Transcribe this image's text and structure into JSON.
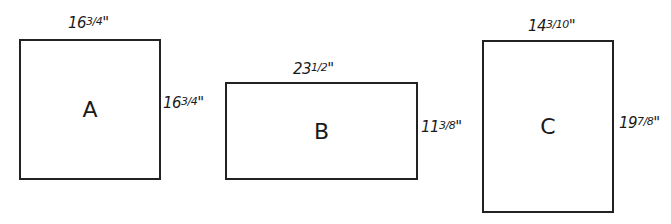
{
  "diagram": {
    "rectangles": [
      {
        "id": "A",
        "label": "A",
        "width_label": "16¾\"",
        "height_label": "16¾\"",
        "width_whole": "16",
        "width_frac": "3/4",
        "height_whole": "16",
        "height_frac": "3/4"
      },
      {
        "id": "B",
        "label": "B",
        "width_label": "23½\"",
        "height_label": "11⅜\"",
        "width_whole": "23",
        "width_frac": "1/2",
        "height_whole": "11",
        "height_frac": "3/8"
      },
      {
        "id": "C",
        "label": "C",
        "width_label": "14 3/10\"",
        "height_label": "19⅞\"",
        "width_whole": "14",
        "width_frac": "3/10",
        "height_whole": "19",
        "height_frac": "7/8"
      }
    ],
    "inch_mark": "\""
  }
}
